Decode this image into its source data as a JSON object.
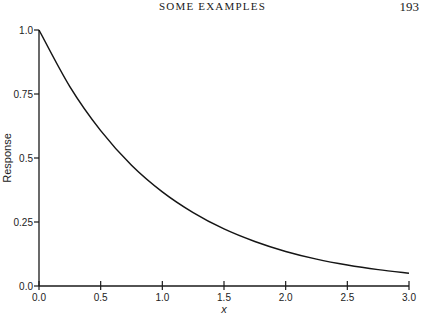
{
  "page": {
    "running_header": "SOME EXAMPLES",
    "page_number": "193"
  },
  "chart_data": {
    "type": "line",
    "title": "",
    "xlabel": "x",
    "ylabel": "Response",
    "xlim": [
      0.0,
      3.0
    ],
    "ylim": [
      0.0,
      1.0
    ],
    "grid": false,
    "legend": null,
    "x_ticks": [
      "0.0",
      "0.5",
      "1.0",
      "1.5",
      "2.0",
      "2.5",
      "3.0"
    ],
    "y_ticks": [
      "0.0",
      "0.25",
      "0.5",
      "0.75",
      "1.0"
    ],
    "series": [
      {
        "name": "Response",
        "x": [
          0.0,
          0.25,
          0.5,
          0.75,
          1.0,
          1.25,
          1.5,
          1.75,
          2.0,
          2.25,
          2.5,
          2.75,
          3.0
        ],
        "y": [
          1.0,
          0.779,
          0.607,
          0.472,
          0.368,
          0.287,
          0.223,
          0.174,
          0.135,
          0.105,
          0.082,
          0.064,
          0.05
        ]
      }
    ]
  }
}
